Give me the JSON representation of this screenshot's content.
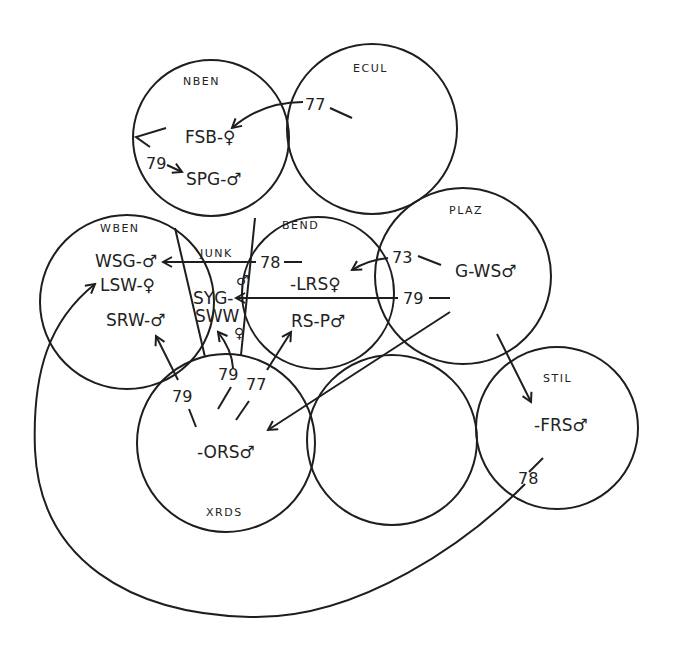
{
  "regions": [
    {
      "id": "NBEN",
      "label": "NBEN"
    },
    {
      "id": "ECUL",
      "label": "ECUL"
    },
    {
      "id": "WBEN",
      "label": "WBEN"
    },
    {
      "id": "JUNK",
      "label": "JUNK"
    },
    {
      "id": "BEND",
      "label": "BEND"
    },
    {
      "id": "PLAZ",
      "label": "PLAZ"
    },
    {
      "id": "STIL",
      "label": "STIL"
    },
    {
      "id": "XRDS",
      "label": "XRDS"
    },
    {
      "id": "UNNAMED",
      "label": ""
    }
  ],
  "nodes": [
    {
      "id": "FSB",
      "label": "FSB-♀",
      "region": "NBEN"
    },
    {
      "id": "SPG",
      "label": "SPG-♂",
      "region": "NBEN"
    },
    {
      "id": "WSG",
      "label": "WSG-♂",
      "region": "WBEN"
    },
    {
      "id": "LSW",
      "label": "LSW-♀",
      "region": "WBEN"
    },
    {
      "id": "SRW",
      "label": "SRW-♂",
      "region": "WBEN"
    },
    {
      "id": "SYG",
      "label": "SYG-",
      "symbol": "♂",
      "region": "JUNK"
    },
    {
      "id": "SWW",
      "label": "SWW",
      "symbol": "♀",
      "region": "JUNK"
    },
    {
      "id": "LRS",
      "label": "-LRS♀",
      "region": "BEND"
    },
    {
      "id": "RSP",
      "label": "RS-P♂",
      "region": "BEND"
    },
    {
      "id": "GWS",
      "label": "G-WS♂",
      "region": "PLAZ"
    },
    {
      "id": "FRS",
      "label": "-FRS♂",
      "region": "STIL"
    },
    {
      "id": "ORS",
      "label": "-ORS♂",
      "region": "XRDS"
    }
  ],
  "movements": [
    {
      "from": "ECUL",
      "to": "FSB",
      "year": "77"
    },
    {
      "from": "NBEN",
      "to": "SPG",
      "year": "79"
    },
    {
      "from": "BEND",
      "to": "WSG",
      "year": "78"
    },
    {
      "from": "PLAZ",
      "to": "LRS",
      "year": "73"
    },
    {
      "from": "PLAZ",
      "to": "SYG",
      "year": "79"
    },
    {
      "from": "PLAZ",
      "to": "ORS",
      "year": ""
    },
    {
      "from": "PLAZ",
      "to": "FRS",
      "year": ""
    },
    {
      "from": "FRS",
      "to": "LSW",
      "year": "78"
    },
    {
      "from": "XRDS",
      "to": "SRW",
      "year": "79"
    },
    {
      "from": "XRDS",
      "to": "SWW",
      "year": "79"
    },
    {
      "from": "XRDS",
      "to": "RSP",
      "year": "77"
    }
  ],
  "years": {
    "ecul_fsb": "77",
    "nben_spg": "79",
    "bend_wsg": "78",
    "plaz_lrs": "73",
    "plaz_syg": "79",
    "frs_lsw": "78",
    "xrds_srw": "79",
    "xrds_sww": "79",
    "xrds_rsp": "77"
  },
  "colors": {
    "ink": "#1e1e1e",
    "background": "#ffffff"
  }
}
